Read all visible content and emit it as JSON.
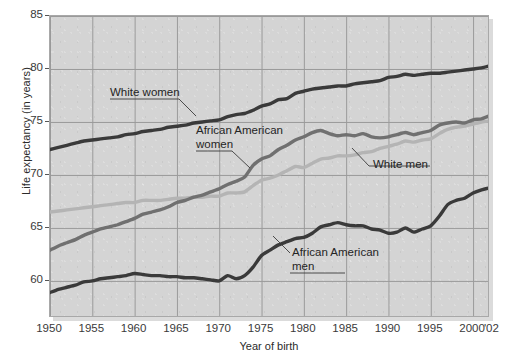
{
  "chart_data": {
    "type": "line",
    "title": "",
    "xlabel": "Year of birth",
    "ylabel": "Life expectancy (in years)",
    "xlim": [
      1950,
      2002
    ],
    "ylim": [
      56.5,
      85
    ],
    "xticks": [
      1950,
      1955,
      1960,
      1965,
      1970,
      1975,
      1980,
      1985,
      1990,
      1995,
      2000
    ],
    "xtick_labels": [
      "1950",
      "1955",
      "1960",
      "1965",
      "1970",
      "1975",
      "1980",
      "1985",
      "1990",
      "1995",
      "2000"
    ],
    "xtick_extra_label": "'02",
    "yticks": [
      60,
      65,
      70,
      75,
      80,
      85
    ],
    "ytick_labels": [
      "60",
      "65",
      "70",
      "75",
      "80",
      "85"
    ],
    "grid": true,
    "legend_position": "inline-annotations",
    "plot_background": "#d4d4d4",
    "gridline_color": "#9a9a9a",
    "series": [
      {
        "name": "White women",
        "color": "#3a3a3a",
        "label": "White women",
        "x": [
          1950,
          1951,
          1952,
          1953,
          1954,
          1955,
          1956,
          1957,
          1958,
          1959,
          1960,
          1961,
          1962,
          1963,
          1964,
          1965,
          1966,
          1967,
          1968,
          1969,
          1970,
          1971,
          1972,
          1973,
          1974,
          1975,
          1976,
          1977,
          1978,
          1979,
          1980,
          1981,
          1982,
          1983,
          1984,
          1985,
          1986,
          1987,
          1988,
          1989,
          1990,
          1991,
          1992,
          1993,
          1994,
          1995,
          1996,
          1997,
          1998,
          1999,
          2000,
          2001,
          2002
        ],
        "values": [
          72.4,
          72.6,
          72.8,
          73.0,
          73.2,
          73.3,
          73.4,
          73.5,
          73.6,
          73.8,
          73.9,
          74.1,
          74.2,
          74.3,
          74.5,
          74.6,
          74.7,
          74.9,
          75.0,
          75.1,
          75.2,
          75.5,
          75.7,
          75.8,
          76.1,
          76.5,
          76.7,
          77.1,
          77.2,
          77.7,
          77.9,
          78.1,
          78.2,
          78.3,
          78.4,
          78.4,
          78.6,
          78.7,
          78.8,
          78.9,
          79.2,
          79.3,
          79.5,
          79.4,
          79.5,
          79.6,
          79.6,
          79.7,
          79.8,
          79.9,
          80.0,
          80.1,
          80.3
        ]
      },
      {
        "name": "African American women",
        "color": "#707070",
        "label": "African American\nwomen",
        "x": [
          1950,
          1951,
          1952,
          1953,
          1954,
          1955,
          1956,
          1957,
          1958,
          1959,
          1960,
          1961,
          1962,
          1963,
          1964,
          1965,
          1966,
          1967,
          1968,
          1969,
          1970,
          1971,
          1972,
          1973,
          1974,
          1975,
          1976,
          1977,
          1978,
          1979,
          1980,
          1981,
          1982,
          1983,
          1984,
          1985,
          1986,
          1987,
          1988,
          1989,
          1990,
          1991,
          1992,
          1993,
          1994,
          1995,
          1996,
          1997,
          1998,
          1999,
          2000,
          2001,
          2002
        ],
        "values": [
          62.9,
          63.3,
          63.6,
          63.9,
          64.3,
          64.6,
          64.9,
          65.1,
          65.3,
          65.6,
          65.9,
          66.3,
          66.5,
          66.7,
          67.0,
          67.4,
          67.6,
          67.9,
          68.1,
          68.4,
          68.7,
          69.1,
          69.4,
          69.8,
          70.9,
          71.5,
          71.8,
          72.4,
          72.8,
          73.3,
          73.6,
          74.0,
          74.2,
          73.9,
          73.7,
          73.8,
          73.7,
          73.9,
          73.6,
          73.5,
          73.6,
          73.8,
          74.0,
          73.8,
          74.0,
          74.2,
          74.7,
          74.9,
          75.0,
          74.9,
          75.2,
          75.3,
          75.6
        ]
      },
      {
        "name": "White men",
        "color": "#b4b4b4",
        "label": "White men",
        "x": [
          1950,
          1951,
          1952,
          1953,
          1954,
          1955,
          1956,
          1957,
          1958,
          1959,
          1960,
          1961,
          1962,
          1963,
          1964,
          1965,
          1966,
          1967,
          1968,
          1969,
          1970,
          1971,
          1972,
          1973,
          1974,
          1975,
          1976,
          1977,
          1978,
          1979,
          1980,
          1981,
          1982,
          1983,
          1984,
          1985,
          1986,
          1987,
          1988,
          1989,
          1990,
          1991,
          1992,
          1993,
          1994,
          1995,
          1996,
          1997,
          1998,
          1999,
          2000,
          2001,
          2002
        ],
        "values": [
          66.5,
          66.6,
          66.7,
          66.8,
          66.9,
          67.0,
          67.1,
          67.2,
          67.3,
          67.4,
          67.4,
          67.6,
          67.6,
          67.6,
          67.7,
          67.8,
          67.8,
          67.9,
          67.9,
          68.0,
          68.0,
          68.3,
          68.3,
          68.4,
          69.0,
          69.5,
          69.7,
          70.0,
          70.4,
          70.8,
          70.7,
          71.1,
          71.5,
          71.6,
          71.8,
          71.8,
          71.9,
          72.1,
          72.2,
          72.5,
          72.7,
          72.9,
          73.2,
          73.1,
          73.3,
          73.4,
          73.9,
          74.3,
          74.5,
          74.6,
          74.8,
          75.0,
          75.1
        ]
      },
      {
        "name": "African American men",
        "color": "#3a3a3a",
        "label": "African American\nmen",
        "x": [
          1950,
          1951,
          1952,
          1953,
          1954,
          1955,
          1956,
          1957,
          1958,
          1959,
          1960,
          1961,
          1962,
          1963,
          1964,
          1965,
          1966,
          1967,
          1968,
          1969,
          1970,
          1971,
          1972,
          1973,
          1974,
          1975,
          1976,
          1977,
          1978,
          1979,
          1980,
          1981,
          1982,
          1983,
          1984,
          1985,
          1986,
          1987,
          1988,
          1989,
          1990,
          1991,
          1992,
          1993,
          1994,
          1995,
          1996,
          1997,
          1998,
          1999,
          2000,
          2001,
          2002
        ],
        "values": [
          58.9,
          59.2,
          59.4,
          59.6,
          59.9,
          60.0,
          60.2,
          60.3,
          60.4,
          60.5,
          60.7,
          60.6,
          60.5,
          60.5,
          60.4,
          60.4,
          60.3,
          60.3,
          60.2,
          60.1,
          60.0,
          60.5,
          60.2,
          60.5,
          61.3,
          62.4,
          62.9,
          63.4,
          63.7,
          64.0,
          64.1,
          64.5,
          65.1,
          65.3,
          65.5,
          65.3,
          65.2,
          65.2,
          64.9,
          64.8,
          64.5,
          64.6,
          65.0,
          64.6,
          64.9,
          65.2,
          66.1,
          67.2,
          67.6,
          67.8,
          68.3,
          68.6,
          68.8
        ]
      }
    ],
    "annotations": [
      {
        "text": "White women",
        "series": "White women"
      },
      {
        "text": "African American\nwomen",
        "series": "African American women"
      },
      {
        "text": "White men",
        "series": "White men"
      },
      {
        "text": "African American\nmen",
        "series": "African American men"
      }
    ]
  },
  "labels": {
    "white_women": "White women",
    "aa_women_line1": "African American",
    "aa_women_line2": "women",
    "white_men": "White men",
    "aa_men_line1": "African American",
    "aa_men_line2": "men",
    "ylabel": "Life expectancy (in years)",
    "xlabel": "Year of birth",
    "x_extra": "'02"
  }
}
